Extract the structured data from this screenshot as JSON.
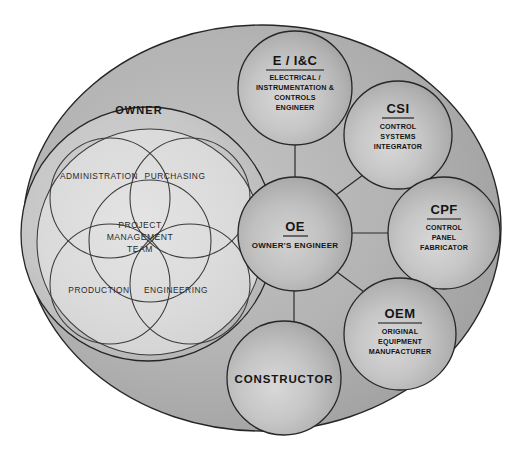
{
  "diagram": {
    "outer_container": {
      "name": "project-universe",
      "fill_dark": "#a9a9a9",
      "fill_light": "#d6d6d6",
      "stroke": "#262626"
    },
    "owner_group": {
      "label": "OWNER",
      "fill_light": "#dcdcdc",
      "departments": [
        {
          "id": "administration",
          "label": "ADMINISTRATION"
        },
        {
          "id": "purchasing",
          "label": "PURCHASING"
        },
        {
          "id": "production",
          "label": "PRODUCTION"
        },
        {
          "id": "engineering",
          "label": "ENGINEERING"
        }
      ],
      "center": {
        "id": "project-management-team",
        "line1": "PROJECT",
        "line2": "MANAGEMENT",
        "line3": "TEAM"
      }
    },
    "hub": {
      "id": "oe",
      "acronym": "OE",
      "expansion_lines": [
        "OWNER'S ENGINEER"
      ],
      "fill_center": "#cfcfcf",
      "fill_edge": "#9a9a9a"
    },
    "satellites": [
      {
        "id": "eic",
        "acronym": "E / I&C",
        "expansion_lines": [
          "ELECTRICAL /",
          "INSTRUMENTATION &",
          "CONTROLS",
          "ENGINEER"
        ],
        "underlined": true
      },
      {
        "id": "csi",
        "acronym": "CSI",
        "expansion_lines": [
          "CONTROL",
          "SYSTEMS",
          "INTEGRATOR"
        ],
        "underlined": true
      },
      {
        "id": "cpf",
        "acronym": "CPF",
        "expansion_lines": [
          "CONTROL",
          "PANEL",
          "FABRICATOR"
        ],
        "underlined": true
      },
      {
        "id": "oem",
        "acronym": "OEM",
        "expansion_lines": [
          "ORIGINAL",
          "EQUIPMENT",
          "MANUFACTURER"
        ],
        "underlined": true
      },
      {
        "id": "constructor",
        "acronym": "CONSTRUCTOR",
        "expansion_lines": [],
        "underlined": false
      }
    ],
    "colors": {
      "ink": "#151515",
      "outline": "#262626",
      "venn_outline": "#3a3a3a",
      "background": "#ffffff"
    }
  }
}
